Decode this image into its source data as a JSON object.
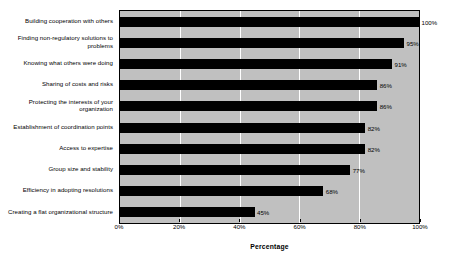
{
  "chart_data": {
    "type": "bar",
    "orientation": "horizontal",
    "title": "",
    "xlabel": "Percentage",
    "ylabel": "",
    "xlim": [
      0,
      100
    ],
    "xticks": [
      "0%",
      "20%",
      "40%",
      "60%",
      "80%",
      "100%"
    ],
    "xtick_values": [
      0,
      20,
      40,
      60,
      80,
      100
    ],
    "grid": true,
    "legend": false,
    "categories": [
      "Building cooperation with others",
      "Finding non-regulatory solutions to problems",
      "Knowing what others were doing",
      "Sharing of costs and risks",
      "Protecting the interests of your organization",
      "Establishment of coordination points",
      "Access to expertise",
      "Group size and stability",
      "Efficiency in adopting resolutions",
      "Creating a flat organizational structure"
    ],
    "values": [
      100,
      95,
      91,
      86,
      86,
      82,
      82,
      77,
      68,
      45
    ],
    "data_labels": [
      "100%",
      "95%",
      "91%",
      "86%",
      "86%",
      "82%",
      "82%",
      "77%",
      "68%",
      "45%"
    ],
    "colors": {
      "bar": "#000000",
      "plot_background": "#c0c0c0",
      "gridline": "#ffffff",
      "axis": "#000000",
      "text": "#000000",
      "figure_background": "#ffffff"
    }
  }
}
